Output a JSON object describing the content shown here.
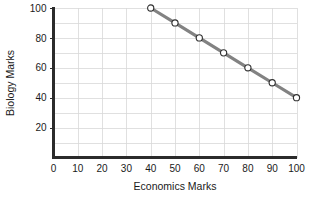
{
  "chart_data": {
    "type": "line",
    "title": "",
    "xlabel": "Economics Marks",
    "ylabel": "Biology Marks",
    "xlim": [
      0,
      100
    ],
    "ylim": [
      0,
      100
    ],
    "grid": true,
    "legend": "none",
    "x": [
      40,
      50,
      60,
      70,
      80,
      90,
      100
    ],
    "values": [
      100,
      90,
      80,
      70,
      60,
      50,
      40
    ],
    "series": [
      {
        "name": "Marks",
        "x": [
          40,
          50,
          60,
          70,
          80,
          90,
          100
        ],
        "values": [
          100,
          90,
          80,
          70,
          60,
          50,
          40
        ],
        "line_color": "#828282",
        "marker": "open-circle",
        "marker_fill": "#ffffff",
        "marker_edge": "#2f2f2f"
      }
    ],
    "xticks": [
      0,
      10,
      20,
      30,
      40,
      50,
      60,
      70,
      80,
      90,
      100
    ],
    "xticklabels": [
      "0",
      "10",
      "20",
      "30",
      "40",
      "50",
      "60",
      "70",
      "80",
      "90",
      "100"
    ],
    "yticks": [
      20,
      40,
      60,
      80,
      100
    ],
    "yticklabels": [
      "20",
      "40",
      "60",
      "80",
      "100"
    ],
    "x_gridlines": [
      10,
      20,
      30,
      40,
      50,
      60,
      70,
      80,
      90,
      100
    ],
    "y_gridlines": [
      10,
      20,
      30,
      40,
      50,
      60,
      70,
      80,
      90,
      100
    ],
    "colors": {
      "background": "#ffffff",
      "grid": "#d8d8d8",
      "axis": "#2b2b2b",
      "text": "#1a1a1a",
      "line": "#828282",
      "marker_fill": "#ffffff",
      "marker_edge": "#2f2f2f"
    }
  }
}
